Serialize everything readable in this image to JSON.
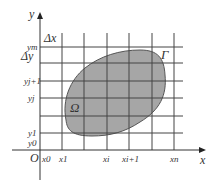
{
  "diagram": {
    "axes": {
      "x_label": "x",
      "y_label": "y",
      "origin_label": "O"
    },
    "x_ticks": [
      "x0",
      "x1",
      "xi",
      "xi+1",
      "xn"
    ],
    "y_ticks": [
      "y0",
      "y1",
      "yj",
      "yj+1",
      "ym"
    ],
    "labels": {
      "delta_x": "Δx",
      "delta_y": "Δy",
      "region": "Ω",
      "boundary": "Γ"
    },
    "colors": {
      "region_fill": "#a6a6a6",
      "grid_line": "#444444",
      "axis": "#333333"
    }
  }
}
